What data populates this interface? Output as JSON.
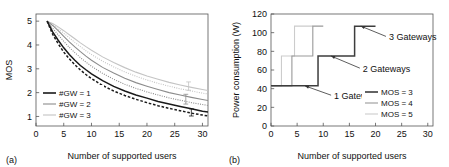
{
  "figure": {
    "panel_a_tag": "(a)",
    "panel_b_tag": "(b)"
  },
  "chart_data": [
    {
      "type": "line",
      "panel": "(a)",
      "title": "",
      "xlabel": "Number of supported users",
      "ylabel": "MOS",
      "xlim": [
        0,
        31
      ],
      "ylim": [
        0.6,
        5.3
      ],
      "xticks": [
        0,
        5,
        10,
        15,
        20,
        25,
        30
      ],
      "yticks": [
        1,
        2,
        3,
        4,
        5
      ],
      "xtick_labels": [
        "0",
        "5",
        "10",
        "15",
        "20",
        "25",
        "30"
      ],
      "ytick_labels": [
        "1",
        "2",
        "3",
        "4",
        "5"
      ],
      "grid": false,
      "legend_position": "lower-left",
      "legend": [
        "#GW = 1",
        "#GW = 2",
        "#GW = 3"
      ],
      "series": [
        {
          "name": "#GW = 1",
          "color": "#1a1a1a",
          "style": "solid",
          "x": [
            2,
            3,
            4,
            5,
            6,
            7,
            8,
            9,
            10,
            12,
            14,
            16,
            18,
            20,
            22,
            24,
            26,
            28,
            30,
            31
          ],
          "values": [
            5.0,
            4.55,
            4.2,
            3.88,
            3.6,
            3.36,
            3.14,
            2.96,
            2.79,
            2.5,
            2.26,
            2.07,
            1.9,
            1.77,
            1.63,
            1.52,
            1.42,
            1.32,
            1.22,
            1.19
          ]
        },
        {
          "name": "#GW = 1 lower bound",
          "color": "#1a1a1a",
          "style": "dashed",
          "x": [
            2,
            3,
            4,
            5,
            6,
            7,
            8,
            9,
            10,
            12,
            14,
            16,
            18,
            20,
            22,
            24,
            26,
            28,
            30,
            31
          ],
          "values": [
            5.0,
            4.45,
            4.05,
            3.7,
            3.42,
            3.17,
            2.95,
            2.76,
            2.59,
            2.3,
            2.07,
            1.88,
            1.72,
            1.58,
            1.45,
            1.34,
            1.24,
            1.14,
            1.06,
            1.02
          ]
        },
        {
          "name": "#GW = 2",
          "color": "#8c8c8c",
          "style": "solid",
          "x": [
            2,
            3,
            4,
            5,
            6,
            7,
            8,
            9,
            10,
            12,
            14,
            16,
            18,
            20,
            22,
            24,
            26,
            28,
            30,
            31
          ],
          "values": [
            5.0,
            4.82,
            4.6,
            4.36,
            4.13,
            3.92,
            3.72,
            3.53,
            3.36,
            3.06,
            2.82,
            2.6,
            2.42,
            2.27,
            2.13,
            2.0,
            1.9,
            1.8,
            1.71,
            1.67
          ]
        },
        {
          "name": "#GW = 2 lower bound",
          "color": "#8c8c8c",
          "style": "dotted",
          "x": [
            2,
            3,
            4,
            5,
            6,
            7,
            8,
            9,
            10,
            12,
            14,
            16,
            18,
            20,
            22,
            24,
            26,
            28,
            30,
            31
          ],
          "values": [
            5.0,
            4.7,
            4.42,
            4.15,
            3.9,
            3.68,
            3.47,
            3.28,
            3.11,
            2.81,
            2.56,
            2.35,
            2.18,
            2.03,
            1.9,
            1.78,
            1.68,
            1.58,
            1.5,
            1.46
          ]
        },
        {
          "name": "#GW = 3",
          "color": "#c4c4c4",
          "style": "solid",
          "x": [
            2,
            3,
            4,
            5,
            6,
            7,
            8,
            9,
            10,
            12,
            14,
            16,
            18,
            20,
            22,
            24,
            26,
            28,
            30,
            31
          ],
          "values": [
            5.0,
            4.9,
            4.76,
            4.6,
            4.43,
            4.26,
            4.09,
            3.93,
            3.78,
            3.5,
            3.26,
            3.05,
            2.86,
            2.7,
            2.56,
            2.43,
            2.32,
            2.22,
            2.13,
            2.09
          ]
        },
        {
          "name": "#GW = 3 lower bound",
          "color": "#c4c4c4",
          "style": "dotted",
          "x": [
            2,
            3,
            4,
            5,
            6,
            7,
            8,
            9,
            10,
            12,
            14,
            16,
            18,
            20,
            22,
            24,
            26,
            28,
            30,
            31
          ],
          "values": [
            5.0,
            4.86,
            4.68,
            4.49,
            4.3,
            4.11,
            3.93,
            3.76,
            3.6,
            3.32,
            3.08,
            2.87,
            2.69,
            2.53,
            2.39,
            2.27,
            2.16,
            2.07,
            1.98,
            1.94
          ]
        }
      ],
      "errorbars": [
        {
          "x": 28,
          "color": "#1a1a1a",
          "low": 1.02,
          "high": 1.32
        },
        {
          "x": 27,
          "color": "#8c8c8c",
          "low": 1.52,
          "high": 1.93
        },
        {
          "x": 27.5,
          "color": "#c4c4c4",
          "low": 2.1,
          "high": 2.45
        }
      ]
    },
    {
      "type": "line",
      "panel": "(b)",
      "title": "",
      "xlabel": "Number of supported users",
      "ylabel": "Power consumption (W)",
      "xlim": [
        0,
        31
      ],
      "ylim": [
        0,
        120
      ],
      "xticks": [
        0,
        5,
        10,
        15,
        20,
        25,
        30
      ],
      "yticks": [
        0,
        20,
        40,
        60,
        80,
        100,
        120
      ],
      "xtick_labels": [
        "0",
        "5",
        "10",
        "15",
        "20",
        "25",
        "30"
      ],
      "ytick_labels": [
        "0",
        "20",
        "40",
        "60",
        "80",
        "100",
        "120"
      ],
      "grid": false,
      "legend_position": "lower-right",
      "legend": [
        "MOS = 3",
        "MOS = 4",
        "MOS = 5"
      ],
      "series": [
        {
          "name": "MOS = 3",
          "color": "#3d3d3d",
          "style": "solid",
          "step": true,
          "x": [
            0,
            4.5,
            4.5,
            9,
            9,
            16,
            16,
            20
          ],
          "values": [
            43,
            43,
            43,
            43,
            75,
            75,
            107,
            107
          ]
        },
        {
          "name": "MOS = 4",
          "color": "#999999",
          "style": "solid",
          "step": true,
          "x": [
            0,
            4,
            4,
            8,
            8,
            10
          ],
          "values": [
            43,
            43,
            75,
            75,
            107,
            107
          ]
        },
        {
          "name": "MOS = 5",
          "color": "#cccccc",
          "style": "solid",
          "step": true,
          "x": [
            0,
            2,
            2,
            4.5,
            4.5,
            8
          ],
          "values": [
            43,
            43,
            75,
            75,
            107,
            107
          ]
        }
      ],
      "annotations": [
        {
          "text": "1 Gateway",
          "tip_x": 6.5,
          "tip_y": 43,
          "label_x": 11.5,
          "label_y": 33
        },
        {
          "text": "2 Gateways",
          "tip_x": 11.5,
          "tip_y": 75,
          "label_x": 17.0,
          "label_y": 62
        },
        {
          "text": "3 Gateways",
          "tip_x": 17.2,
          "tip_y": 107,
          "label_x": 22.0,
          "label_y": 96
        }
      ]
    }
  ]
}
